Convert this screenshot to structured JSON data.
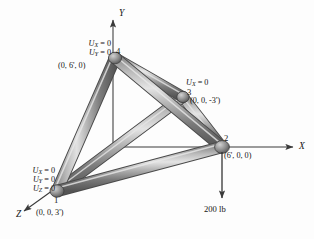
{
  "figure": {
    "type": "engineering-diagram",
    "background_color": "#fdfdfd",
    "member_color_light": "#d9d9d9",
    "member_color_mid": "#a2a2a2",
    "member_color_dark": "#5e5e5e",
    "axis_color": "#3a3a3a",
    "text_color": "#141414"
  },
  "axes": [
    {
      "name": "Y",
      "label": "Y",
      "direction": "up",
      "tip": [
        113,
        14
      ]
    },
    {
      "name": "X",
      "label": "X",
      "direction": "right",
      "tip": [
        299,
        147
      ]
    },
    {
      "name": "Z",
      "label": "Z",
      "direction": "down-left",
      "tip": [
        17,
        216
      ]
    }
  ],
  "origin": {
    "x": 113,
    "y": 147
  },
  "nodes": [
    {
      "id": "1",
      "label": "1",
      "coordinate_text": "(0, 0, 3')",
      "position": [
        57,
        191
      ],
      "constraints": [
        "U_X = 0",
        "U_Y = 0",
        "U_Z = 0"
      ],
      "constraint_symbols": [
        {
          "symbol": "U",
          "sub": "X",
          "value": "0"
        },
        {
          "symbol": "U",
          "sub": "Y",
          "value": "0"
        },
        {
          "symbol": "U",
          "sub": "Z",
          "value": "0"
        }
      ]
    },
    {
      "id": "2",
      "label": "2",
      "coordinate_text": "(6', 0, 0)",
      "position": [
        222,
        147
      ],
      "constraints": [],
      "constraint_symbols": []
    },
    {
      "id": "3",
      "label": "3",
      "coordinate_text": "(0, 0, -3')",
      "position": [
        183,
        97
      ],
      "constraints": [
        "U_X = 0"
      ],
      "constraint_symbols": [
        {
          "symbol": "U",
          "sub": "X",
          "value": "0"
        }
      ]
    },
    {
      "id": "4",
      "label": "4",
      "coordinate_text": "(0, 6', 0)",
      "position": [
        115,
        58
      ],
      "constraints": [
        "U_X = 0",
        "U_Y = 0"
      ],
      "constraint_symbols": [
        {
          "symbol": "U",
          "sub": "X",
          "value": "0"
        },
        {
          "symbol": "U",
          "sub": "Y",
          "value": "0"
        }
      ]
    }
  ],
  "members": [
    {
      "from": "1",
      "to": "4"
    },
    {
      "from": "1",
      "to": "2"
    },
    {
      "from": "1",
      "to": "3"
    },
    {
      "from": "2",
      "to": "4"
    },
    {
      "from": "2",
      "to": "3"
    },
    {
      "from": "3",
      "to": "4"
    }
  ],
  "load": {
    "label": "200 lb",
    "magnitude": 200,
    "unit": "lb",
    "direction": "down",
    "applied_at_node": "2",
    "arrow_from": [
      222,
      152
    ],
    "arrow_to": [
      222,
      203
    ]
  }
}
